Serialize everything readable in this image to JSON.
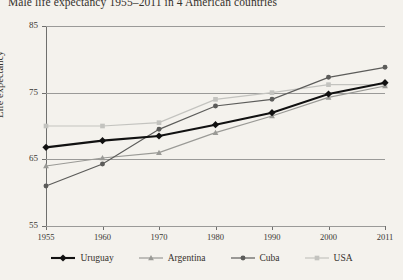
{
  "chart_data": {
    "type": "line",
    "title": "Male life expectancy 1955–2011 in 4 American countries",
    "xlabel": "",
    "ylabel": "Life expectancy",
    "categories": [
      "1955",
      "1960",
      "1970",
      "1980",
      "1990",
      "2000",
      "2011"
    ],
    "ylim": [
      55,
      85
    ],
    "yticks": [
      55,
      65,
      75,
      85
    ],
    "grid": true,
    "legend_position": "bottom",
    "series": [
      {
        "name": "Uruguay",
        "color": "#111111",
        "marker": "diamond",
        "values": [
          66.8,
          67.8,
          68.5,
          70.2,
          72.0,
          74.8,
          76.5
        ]
      },
      {
        "name": "Argentina",
        "color": "#9a9a96",
        "marker": "triangle",
        "values": [
          64.0,
          65.2,
          66.0,
          69.0,
          71.5,
          74.3,
          76.0
        ]
      },
      {
        "name": "Cuba",
        "color": "#5c5c5a",
        "marker": "circle",
        "values": [
          61.0,
          64.3,
          69.5,
          73.0,
          74.0,
          77.3,
          78.8
        ]
      },
      {
        "name": "USA",
        "color": "#c3c3bf",
        "marker": "square",
        "values": [
          70.0,
          70.0,
          70.5,
          74.0,
          75.0,
          76.2,
          76.2
        ]
      }
    ]
  }
}
